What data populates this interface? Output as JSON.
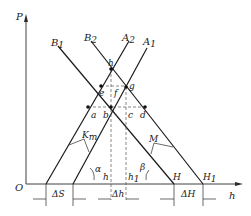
{
  "diagram": {
    "axes": {
      "y_label": "P",
      "x_label": "h",
      "origin_label": "O"
    },
    "lines": [
      {
        "id": "A1",
        "label": "A",
        "sub": "1"
      },
      {
        "id": "A2",
        "label": "A",
        "sub": "2"
      },
      {
        "id": "B1",
        "label": "B",
        "sub": "1"
      },
      {
        "id": "B2",
        "label": "B",
        "sub": "2"
      }
    ],
    "points": [
      "h",
      "e",
      "f",
      "g",
      "a",
      "b",
      "c",
      "d"
    ],
    "stiffness_labels": {
      "Km_main": "K",
      "Km_sub": "m",
      "M": "M"
    },
    "angles": {
      "alpha": "α",
      "beta": "β"
    },
    "axis_points": {
      "h": "h",
      "h1_main": "h",
      "h1_sub": "1",
      "H": "H",
      "H1_main": "H",
      "H1_sub": "1"
    },
    "dimensions": {
      "dS": "ΔS",
      "dh": "Δh",
      "dH": "ΔH"
    }
  }
}
